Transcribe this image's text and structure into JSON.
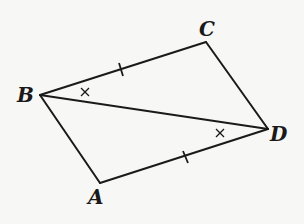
{
  "diagram": {
    "type": "geometry",
    "figure": "quadrilateral ABCD with diagonal BD",
    "points": {
      "A": {
        "label": "A",
        "x": 100,
        "y": 183
      },
      "B": {
        "label": "B",
        "x": 40,
        "y": 95
      },
      "C": {
        "label": "C",
        "x": 206,
        "y": 42
      },
      "D": {
        "label": "D",
        "x": 268,
        "y": 129
      }
    },
    "segments": [
      "AB",
      "BC",
      "CD",
      "DA",
      "BD"
    ],
    "equal_sides_marks": [
      "BC",
      "AD"
    ],
    "equal_angle_marks": [
      "angle CBD",
      "angle ADB"
    ],
    "colors": {
      "stroke": "#1a1a1a",
      "background": "#f7f7f5"
    }
  }
}
